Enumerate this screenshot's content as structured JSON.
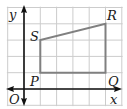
{
  "diagram": {
    "axes": {
      "x_label": "x",
      "y_label": "y",
      "origin_label": "O",
      "x_range": [
        -1,
        6
      ],
      "y_range": [
        -1,
        5
      ]
    },
    "grid": true,
    "shape": {
      "name": "PQRS",
      "vertices": [
        {
          "label": "P",
          "x": 1,
          "y": 1
        },
        {
          "label": "Q",
          "x": 5,
          "y": 1
        },
        {
          "label": "R",
          "x": 5,
          "y": 4
        },
        {
          "label": "S",
          "x": 1,
          "y": 3
        }
      ]
    },
    "colors": {
      "grid": "#cccccc",
      "axis": "#111111",
      "shape_stroke": "#808080"
    }
  }
}
